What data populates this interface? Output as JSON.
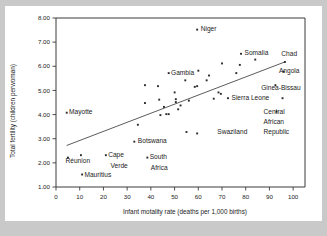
{
  "chart_data": {
    "type": "scatter",
    "title": "",
    "xlabel": "Infant motality rate (deaths per 1,000 births)",
    "ylabel": "Total fertility (children perwoman)",
    "xlim": [
      0,
      105
    ],
    "ylim": [
      1.0,
      8.0
    ],
    "xticks": [
      "0",
      "10",
      "20",
      "30",
      "40",
      "50",
      "60",
      "70",
      "80",
      "90",
      "100"
    ],
    "xtick_values": [
      0,
      10,
      20,
      30,
      40,
      50,
      60,
      70,
      80,
      90,
      100
    ],
    "yticks": [
      "1.00",
      "2.00",
      "3.00",
      "4.00",
      "5.00",
      "6.00",
      "7.00",
      "8.00"
    ],
    "ytick_values": [
      1,
      2,
      3,
      4,
      5,
      6,
      7,
      8
    ],
    "grid": false,
    "legend": "none",
    "trendline": {
      "x0": 4.5,
      "y0": 2.72,
      "x1": 96.5,
      "y1": 6.18
    },
    "points": [
      {
        "x": 4.5,
        "y": 4.08,
        "label": "Mayotte",
        "label_pos": "right"
      },
      {
        "x": 5.0,
        "y": 2.22,
        "label": "Réunion",
        "label_pos": "below"
      },
      {
        "x": 10.5,
        "y": 2.32,
        "label": "",
        "label_pos": ""
      },
      {
        "x": 11.0,
        "y": 1.52,
        "label": "Mauritius",
        "label_pos": "right"
      },
      {
        "x": 21.0,
        "y": 2.32,
        "label": "Cape Verde",
        "label_pos": "right"
      },
      {
        "x": 33.0,
        "y": 2.88,
        "label": "Botswana",
        "label_pos": "right"
      },
      {
        "x": 34.5,
        "y": 3.58,
        "label": "",
        "label_pos": ""
      },
      {
        "x": 37.5,
        "y": 5.22,
        "label": "",
        "label_pos": ""
      },
      {
        "x": 37.5,
        "y": 4.48,
        "label": "",
        "label_pos": ""
      },
      {
        "x": 38.5,
        "y": 2.22,
        "label": "South Africa",
        "label_pos": "right"
      },
      {
        "x": 43.0,
        "y": 5.18,
        "label": "",
        "label_pos": ""
      },
      {
        "x": 43.5,
        "y": 4.62,
        "label": "",
        "label_pos": ""
      },
      {
        "x": 44.0,
        "y": 3.98,
        "label": "",
        "label_pos": ""
      },
      {
        "x": 45.5,
        "y": 4.32,
        "label": "",
        "label_pos": ""
      },
      {
        "x": 46.5,
        "y": 4.02,
        "label": "",
        "label_pos": ""
      },
      {
        "x": 47.5,
        "y": 4.02,
        "label": "",
        "label_pos": ""
      },
      {
        "x": 47.5,
        "y": 5.72,
        "label": "Gambia",
        "label_pos": "right"
      },
      {
        "x": 50.0,
        "y": 4.92,
        "label": "",
        "label_pos": ""
      },
      {
        "x": 50.5,
        "y": 4.64,
        "label": "",
        "label_pos": ""
      },
      {
        "x": 50.5,
        "y": 4.52,
        "label": "",
        "label_pos": ""
      },
      {
        "x": 51.5,
        "y": 4.22,
        "label": "",
        "label_pos": ""
      },
      {
        "x": 52.5,
        "y": 4.38,
        "label": "",
        "label_pos": ""
      },
      {
        "x": 54.5,
        "y": 5.42,
        "label": "",
        "label_pos": ""
      },
      {
        "x": 55.0,
        "y": 3.28,
        "label": "",
        "label_pos": ""
      },
      {
        "x": 56.0,
        "y": 4.58,
        "label": "",
        "label_pos": ""
      },
      {
        "x": 58.5,
        "y": 5.15,
        "label": "",
        "label_pos": ""
      },
      {
        "x": 59.5,
        "y": 5.18,
        "label": "",
        "label_pos": ""
      },
      {
        "x": 59.5,
        "y": 3.22,
        "label": "",
        "label_pos": ""
      },
      {
        "x": 59.5,
        "y": 7.52,
        "label": "Niger",
        "label_pos": "right"
      },
      {
        "x": 60.0,
        "y": 5.82,
        "label": "",
        "label_pos": ""
      },
      {
        "x": 63.5,
        "y": 5.42,
        "label": "",
        "label_pos": ""
      },
      {
        "x": 64.5,
        "y": 5.62,
        "label": "Swaziland",
        "label_pos": "farright"
      },
      {
        "x": 66.5,
        "y": 4.66,
        "label": "",
        "label_pos": ""
      },
      {
        "x": 68.5,
        "y": 4.92,
        "label": "",
        "label_pos": ""
      },
      {
        "x": 69.5,
        "y": 4.86,
        "label": "",
        "label_pos": ""
      },
      {
        "x": 70.0,
        "y": 6.12,
        "label": "",
        "label_pos": ""
      },
      {
        "x": 72.5,
        "y": 4.68,
        "label": "Sierra Leone",
        "label_pos": "right"
      },
      {
        "x": 76.0,
        "y": 5.72,
        "label": "",
        "label_pos": ""
      },
      {
        "x": 77.5,
        "y": 6.06,
        "label": "",
        "label_pos": ""
      },
      {
        "x": 78.0,
        "y": 6.52,
        "label": "Somalia",
        "label_pos": "right"
      },
      {
        "x": 84.0,
        "y": 6.28,
        "label": "",
        "label_pos": ""
      },
      {
        "x": 92.5,
        "y": 5.22,
        "label": "Ginea-Bissau",
        "label_pos": "above"
      },
      {
        "x": 93.0,
        "y": 4.12,
        "label": "Central African Republic",
        "label_pos": "above"
      },
      {
        "x": 95.5,
        "y": 4.68,
        "label": "",
        "label_pos": ""
      },
      {
        "x": 96.5,
        "y": 6.18,
        "label": "Chad",
        "label_pos": "above"
      },
      {
        "x": 96.0,
        "y": 5.78,
        "label": "Angola",
        "label_pos": "above"
      }
    ],
    "annotations": [
      {
        "text": "Niger",
        "x": 61.0,
        "y": 7.55
      },
      {
        "text": "Somalia",
        "x": 79.5,
        "y": 6.55
      },
      {
        "text": "Chad",
        "x": 95.0,
        "y": 6.52
      },
      {
        "text": "Angola",
        "x": 94.0,
        "y": 5.82
      },
      {
        "text": "Ginea-Bissau",
        "x": 86.5,
        "y": 5.12
      },
      {
        "text": "Sierra Leone",
        "x": 74.0,
        "y": 4.7
      },
      {
        "text": "Gambia",
        "x": 48.5,
        "y": 5.75
      },
      {
        "text": "Mayotte",
        "x": 5.5,
        "y": 4.1
      },
      {
        "text": "Botswana",
        "x": 34.5,
        "y": 2.9
      },
      {
        "text": "Swaziland",
        "x": 68.0,
        "y": 3.3
      },
      {
        "text": "Réunion",
        "x": 4.0,
        "y": 2.08
      },
      {
        "text": "Cape",
        "x": 22.0,
        "y": 2.35
      },
      {
        "text": "Verde",
        "x": 23.0,
        "y": 1.88
      },
      {
        "text": "Mauritius",
        "x": 12.0,
        "y": 1.52
      },
      {
        "text": "South",
        "x": 39.5,
        "y": 2.25
      },
      {
        "text": "Africa",
        "x": 40.0,
        "y": 1.8
      },
      {
        "text": "Central",
        "x": 87.5,
        "y": 4.12
      },
      {
        "text": "African",
        "x": 87.5,
        "y": 3.72
      },
      {
        "text": "Republic",
        "x": 87.5,
        "y": 3.3
      }
    ]
  },
  "figure": {
    "background_color": "#c9c9c9",
    "card_color": "#ffffff",
    "axis_color": "#3a3a3a",
    "point_color": "#2b2b2b",
    "trend_color": "#4a4a4a"
  }
}
